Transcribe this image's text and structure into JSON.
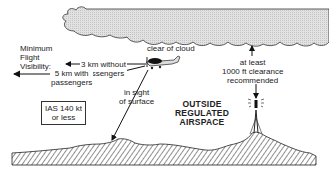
{
  "diagram": {
    "labels": {
      "min_vis_line1": "Minimum",
      "min_vis_line2": "Flight",
      "min_vis_line3": "Visibility:",
      "vis_no_pax_line1": "3 km without",
      "vis_no_pax_line2": "passengers",
      "vis_pax_line1": "5 km with",
      "vis_pax_line2": "passengers",
      "clear_of_cloud": "clear of cloud",
      "clearance_line1": "at least",
      "clearance_line2": "1000 ft clearance",
      "clearance_line3": "recommended",
      "sight_line1": "in sight",
      "sight_line2": "of surface",
      "ias_line1": "IAS 140 kt",
      "ias_line2": "or less",
      "airspace_line1": "OUTSIDE",
      "airspace_line2": "REGULATED",
      "airspace_line3": "AIRSPACE"
    },
    "elements": {
      "cloud": "cloud-shape",
      "aircraft": "aircraft-icon",
      "mast": "radio-mast-icon",
      "terrain": "hatched-terrain"
    },
    "colors": {
      "cloud_fill": "#d9d9d9",
      "ink": "#222222",
      "background": "#ffffff"
    }
  }
}
